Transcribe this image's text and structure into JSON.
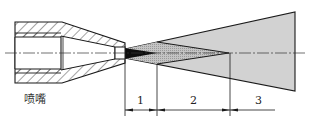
{
  "diagram": {
    "type": "spray nozzle jet zones cross-section",
    "nozzle_label": "喷嘴",
    "zones": [
      {
        "id": "zone-1",
        "label": "1"
      },
      {
        "id": "zone-2",
        "label": "2"
      },
      {
        "id": "zone-3",
        "label": "3"
      }
    ],
    "colors": {
      "line": "#1a1a1a",
      "spray_fill": "#cfcfcf",
      "zone2_fill": "#bdbdbd",
      "core_fill": "#111111",
      "hatch": "#333333"
    }
  }
}
